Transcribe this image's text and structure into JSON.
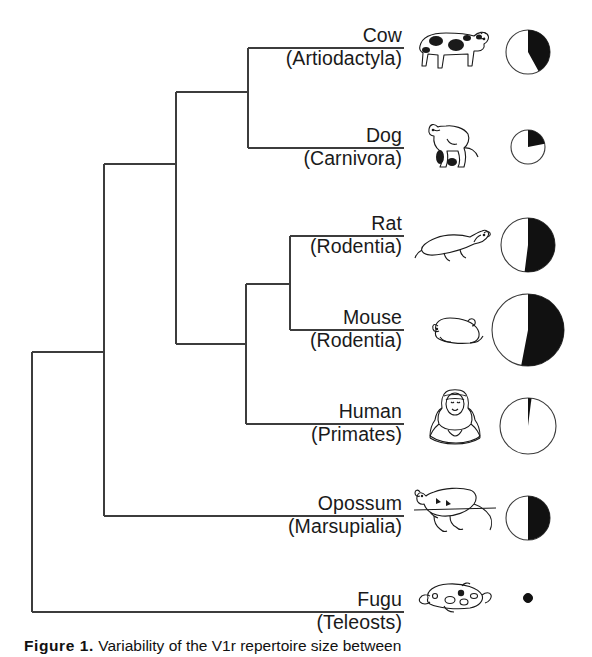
{
  "figure": {
    "caption_label": "Figure 1.",
    "caption_text": "  Variability of the V1r repertoire size between",
    "background_color": "#ffffff",
    "line_color": "#3c3c3c",
    "pie_fill_color": "#111111",
    "pie_empty_color": "#ffffff"
  },
  "chart_data": {
    "type": "pie",
    "title": "Variability of the V1r repertoire size between",
    "legend_position": "none",
    "grid": false,
    "taxa": [
      {
        "common_name": "Cow",
        "order": "(Artiodactyla)",
        "icon": "cow-illustration",
        "pie_radius_px": 22,
        "black_fraction": 0.42,
        "white_fraction": 0.58
      },
      {
        "common_name": "Dog",
        "order": "(Carnivora)",
        "icon": "dog-illustration",
        "pie_radius_px": 17,
        "black_fraction": 0.22,
        "white_fraction": 0.78
      },
      {
        "common_name": "Rat",
        "order": "(Rodentia)",
        "icon": "rat-illustration",
        "pie_radius_px": 27,
        "black_fraction": 0.52,
        "white_fraction": 0.48
      },
      {
        "common_name": "Mouse",
        "order": "(Rodentia)",
        "icon": "mouse-illustration",
        "pie_radius_px": 36,
        "black_fraction": 0.53,
        "white_fraction": 0.47
      },
      {
        "common_name": "Human",
        "order": "(Primates)",
        "icon": "human-illustration",
        "pie_radius_px": 28,
        "black_fraction": 0.02,
        "white_fraction": 0.98
      },
      {
        "common_name": "Opossum",
        "order": "(Marsupialia)",
        "icon": "opossum-illustration",
        "pie_radius_px": 22,
        "black_fraction": 0.5,
        "white_fraction": 0.5
      },
      {
        "common_name": "Fugu",
        "order": "(Teleosts)",
        "icon": "fugu-illustration",
        "pie_radius_px": 4,
        "black_fraction": 1.0,
        "white_fraction": 0.0
      }
    ],
    "tree_topology": "(((Cow,Dog),((Rat,Mouse),Human)),Opossum),Fugu"
  }
}
